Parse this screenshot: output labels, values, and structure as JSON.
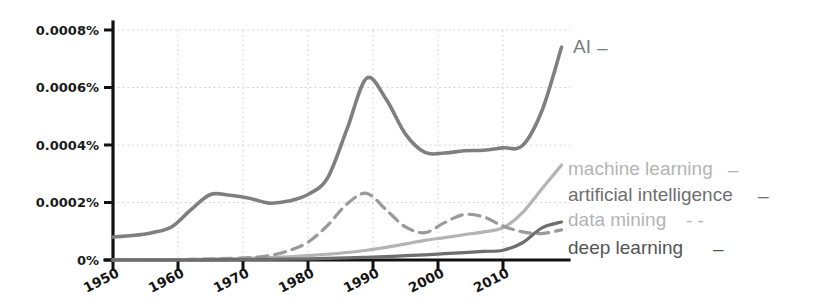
{
  "chart_data": {
    "type": "line",
    "title": "",
    "subtitle": "",
    "xlabel": "",
    "ylabel": "",
    "xlim": [
      1950,
      2019
    ],
    "ylim": [
      0,
      0.0009
    ],
    "grid": true,
    "grid_style": "dotted",
    "legend_position": "right-inline-labels",
    "y_tick_labels": [
      "0.0008%",
      "0.0006%",
      "0.0004%",
      "0.0002%",
      "0%"
    ],
    "y_tick_values": [
      0.0008,
      0.0006,
      0.0004,
      0.0002,
      0
    ],
    "x_tick_labels": [
      "1950",
      "1960",
      "1970",
      "1980",
      "1990",
      "2000",
      "2010"
    ],
    "x_tick_values": [
      1950,
      1960,
      1970,
      1980,
      1990,
      2000,
      2010
    ],
    "x": [
      1950,
      1953,
      1956,
      1959,
      1962,
      1965,
      1968,
      1971,
      1974,
      1977,
      1980,
      1983,
      1986,
      1989,
      1992,
      1995,
      1998,
      2001,
      2004,
      2007,
      2010,
      2013,
      2016,
      2019
    ],
    "series": [
      {
        "name": "AI",
        "label": "AI",
        "color": "#7f7f7f",
        "linestyle": "solid",
        "marker_glyph": "–",
        "values": [
          8e-05,
          8.5e-05,
          9.5e-05,
          0.000115,
          0.000175,
          0.000228,
          0.000225,
          0.000215,
          0.000198,
          0.000205,
          0.000228,
          0.000285,
          0.000455,
          0.000632,
          0.00056,
          0.000438,
          0.000374,
          0.000372,
          0.00038,
          0.000382,
          0.00039,
          0.000398,
          0.00052,
          0.00074
        ]
      },
      {
        "name": "data mining",
        "label": "data mining",
        "color": "#9a9a9a",
        "linestyle": "dashed",
        "marker_glyph": "- -",
        "values": [
          5e-07,
          8e-07,
          1e-06,
          1.5e-06,
          2e-06,
          3.5e-06,
          5.5e-06,
          8e-06,
          1.5e-05,
          3.2e-05,
          6.2e-05,
          0.00012,
          0.000195,
          0.000232,
          0.000175,
          0.000115,
          9.5e-05,
          0.00013,
          0.000158,
          0.00015,
          0.000118,
          9.8e-05,
          9.2e-05,
          0.000105
        ]
      },
      {
        "name": "machine learning",
        "label": "machine learning",
        "color": "#b4b4b4",
        "linestyle": "solid",
        "marker_glyph": "–",
        "values": [
          3e-07,
          5e-07,
          8e-07,
          1.2e-06,
          2e-06,
          3e-06,
          4.5e-06,
          6e-06,
          8e-06,
          1.1e-05,
          1.5e-05,
          2e-05,
          2.6e-05,
          3.4e-05,
          4.4e-05,
          5.6e-05,
          6.8e-05,
          7.8e-05,
          8.8e-05,
          9.8e-05,
          0.000112,
          0.000165,
          0.000248,
          0.00033
        ]
      },
      {
        "name": "deep learning",
        "label": "deep learning",
        "color": "#6e6e6e",
        "linestyle": "solid",
        "marker_glyph": "–",
        "values": [
          2e-07,
          3e-07,
          4e-07,
          6e-07,
          8e-07,
          1e-06,
          1.4e-06,
          1.8e-06,
          2.4e-06,
          3.2e-06,
          4.2e-06,
          5.5e-06,
          7.2e-06,
          9.5e-06,
          1.2e-05,
          1.5e-05,
          1.8e-05,
          2.2e-05,
          2.6e-05,
          3e-05,
          3.4e-05,
          6e-05,
          0.000112,
          0.000132
        ]
      }
    ],
    "annotations": [
      {
        "text": "AI",
        "for_series": "AI"
      }
    ]
  },
  "colors": {
    "axis": "#111111",
    "grid": "#cccccc",
    "background": "#ffffff",
    "tick_label": "#1b1b1b"
  }
}
